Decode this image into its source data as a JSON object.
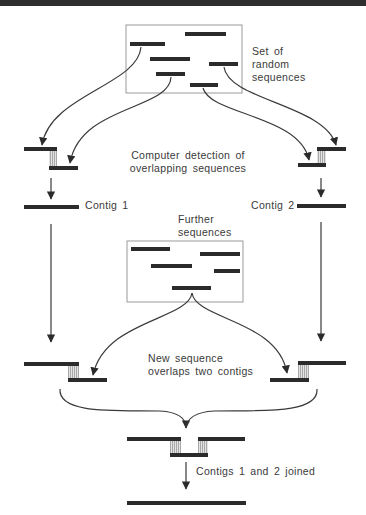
{
  "diagram": {
    "labels": {
      "random_set_line1": "Set of",
      "random_set_line2": "random",
      "random_set_line3": "sequences",
      "detection_line1": "Computer detection of",
      "detection_line2": "overlapping sequences",
      "contig1": "Contig 1",
      "contig2": "Contig 2",
      "further_line1": "Further",
      "further_line2": "sequences",
      "new_seq_line1": "New sequence",
      "new_seq_line2": "overlaps two contigs",
      "joined": "Contigs 1 and 2 joined"
    },
    "colors": {
      "bar": "#2b2b2b",
      "line": "#3a3a3a",
      "box_border": "#9a9a9a",
      "hatch": "#b8b8b8",
      "top_band": "#2e2e2e"
    },
    "stages": [
      "Set of random sequences",
      "Computer detection of overlapping sequences",
      "Contig 1 and Contig 2 formed",
      "Further sequences",
      "New sequence overlaps two contigs",
      "Contigs 1 and 2 joined"
    ]
  }
}
